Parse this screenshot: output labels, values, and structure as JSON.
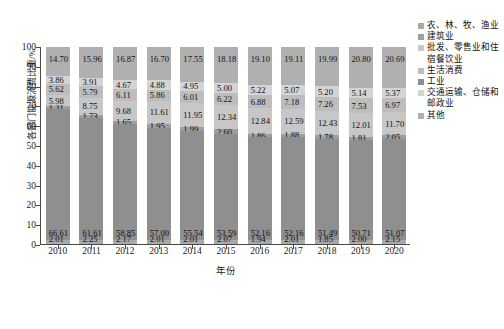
{
  "chart_data": {
    "type": "bar",
    "subtype": "stacked-percentage",
    "title": "",
    "xlabel": "年份",
    "ylabel": "各部门能源消费比重/%",
    "ylim": [
      0,
      100
    ],
    "yticks": [
      0,
      10,
      20,
      30,
      40,
      50,
      60,
      70,
      80,
      90,
      100
    ],
    "grid": false,
    "legend_position": "right",
    "categories": [
      "2010",
      "2011",
      "2012",
      "2013",
      "2014",
      "2015",
      "2016",
      "2017",
      "2018",
      "2019",
      "2020"
    ],
    "series": [
      {
        "name": "农、林、牧、渔业",
        "color": "#a9a9a9",
        "values": [
          2.01,
          2.25,
          2.17,
          2.01,
          2.01,
          2.07,
          1.94,
          2.01,
          1.85,
          2.0,
          2.15
        ]
      },
      {
        "name": "建筑业",
        "color": "#9e9e9e",
        "values": [
          1.21,
          1.73,
          1.65,
          1.95,
          1.99,
          2.6,
          1.86,
          1.88,
          1.78,
          1.81,
          2.05
        ]
      },
      {
        "name": "批发、零售业和住宿餐饮业",
        "color": "#c7c7c7",
        "values": [
          5.98,
          8.75,
          9.68,
          11.61,
          11.95,
          12.34,
          12.84,
          12.59,
          12.43,
          12.01,
          11.7
        ]
      },
      {
        "name": "生活消费",
        "color": "#bdbdbd",
        "values": [
          5.62,
          5.79,
          6.11,
          5.86,
          6.01,
          6.22,
          6.88,
          7.18,
          7.26,
          7.53,
          6.97
        ]
      },
      {
        "name": "工业",
        "color": "#8f8f8f",
        "values": [
          66.61,
          61.61,
          58.85,
          57.0,
          55.54,
          53.59,
          52.16,
          52.16,
          51.49,
          50.71,
          51.07
        ]
      },
      {
        "name": "交通运输、仓储和邮政业",
        "color": "#d4d4d4",
        "values": [
          3.86,
          3.91,
          4.67,
          4.88,
          4.95,
          5.0,
          5.22,
          5.07,
          5.2,
          5.14,
          5.37
        ]
      },
      {
        "name": "其他",
        "color": "#b0b0b0",
        "values": [
          14.7,
          15.96,
          16.87,
          16.7,
          17.55,
          18.18,
          19.1,
          19.11,
          19.99,
          20.8,
          20.69
        ]
      }
    ],
    "stack_order_bottom_to_top": [
      "农、林、牧、渔业",
      "工业",
      "建筑业",
      "批发、零售业和住宿餐饮业",
      "生活消费",
      "交通运输、仓储和邮政业",
      "其他"
    ],
    "stacks": [
      {
        "category": "2010",
        "segments": [
          {
            "name": "农、林、牧、渔业",
            "value": 2.01,
            "color": "#a9a9a9",
            "label": "2.01"
          },
          {
            "name": "工业",
            "value": 66.61,
            "color": "#8f8f8f",
            "label": "66.61"
          },
          {
            "name": "建筑业",
            "value": 1.21,
            "color": "#9e9e9e",
            "label": "1.21"
          },
          {
            "name": "批发、零售业和住宿餐饮业",
            "value": 5.98,
            "color": "#c7c7c7",
            "label": "5.98"
          },
          {
            "name": "生活消费",
            "value": 5.62,
            "color": "#bdbdbd",
            "label": "5.62"
          },
          {
            "name": "交通运输、仓储和邮政业",
            "value": 3.86,
            "color": "#d4d4d4",
            "label": "3.86"
          },
          {
            "name": "其他",
            "value": 14.7,
            "color": "#b0b0b0",
            "label": "14.70"
          }
        ]
      },
      {
        "category": "2011",
        "segments": [
          {
            "name": "农、林、牧、渔业",
            "value": 2.25,
            "color": "#a9a9a9",
            "label": "2.25"
          },
          {
            "name": "工业",
            "value": 61.61,
            "color": "#8f8f8f",
            "label": "61.61"
          },
          {
            "name": "建筑业",
            "value": 1.73,
            "color": "#9e9e9e",
            "label": "1.73"
          },
          {
            "name": "批发、零售业和住宿餐饮业",
            "value": 8.75,
            "color": "#c7c7c7",
            "label": "8.75"
          },
          {
            "name": "生活消费",
            "value": 5.79,
            "color": "#bdbdbd",
            "label": "5.79"
          },
          {
            "name": "交通运输、仓储和邮政业",
            "value": 3.91,
            "color": "#d4d4d4",
            "label": "3.91"
          },
          {
            "name": "其他",
            "value": 15.96,
            "color": "#b0b0b0",
            "label": "15.96"
          }
        ]
      },
      {
        "category": "2012",
        "segments": [
          {
            "name": "农、林、牧、渔业",
            "value": 2.17,
            "color": "#a9a9a9",
            "label": "2.17"
          },
          {
            "name": "工业",
            "value": 58.85,
            "color": "#8f8f8f",
            "label": "58.85"
          },
          {
            "name": "建筑业",
            "value": 1.65,
            "color": "#9e9e9e",
            "label": "1.65"
          },
          {
            "name": "批发、零售业和住宿餐饮业",
            "value": 9.68,
            "color": "#c7c7c7",
            "label": "9.68"
          },
          {
            "name": "生活消费",
            "value": 6.11,
            "color": "#bdbdbd",
            "label": "6.11"
          },
          {
            "name": "交通运输、仓储和邮政业",
            "value": 4.67,
            "color": "#d4d4d4",
            "label": "4.67"
          },
          {
            "name": "其他",
            "value": 16.87,
            "color": "#b0b0b0",
            "label": "16.87"
          }
        ]
      },
      {
        "category": "2013",
        "segments": [
          {
            "name": "农、林、牧、渔业",
            "value": 2.01,
            "color": "#a9a9a9",
            "label": "2.01"
          },
          {
            "name": "工业",
            "value": 57.0,
            "color": "#8f8f8f",
            "label": "57.00"
          },
          {
            "name": "建筑业",
            "value": 1.95,
            "color": "#9e9e9e",
            "label": "1.95"
          },
          {
            "name": "批发、零售业和住宿餐饮业",
            "value": 11.61,
            "color": "#c7c7c7",
            "label": "11.61"
          },
          {
            "name": "生活消费",
            "value": 5.86,
            "color": "#bdbdbd",
            "label": "5.86"
          },
          {
            "name": "交通运输、仓储和邮政业",
            "value": 4.88,
            "color": "#d4d4d4",
            "label": "4.88"
          },
          {
            "name": "其他",
            "value": 16.7,
            "color": "#b0b0b0",
            "label": "16.70"
          }
        ]
      },
      {
        "category": "2014",
        "segments": [
          {
            "name": "农、林、牧、渔业",
            "value": 2.01,
            "color": "#a9a9a9",
            "label": "2.01"
          },
          {
            "name": "工业",
            "value": 55.54,
            "color": "#8f8f8f",
            "label": "55.54"
          },
          {
            "name": "建筑业",
            "value": 1.99,
            "color": "#9e9e9e",
            "label": "1.99"
          },
          {
            "name": "批发、零售业和住宿餐饮业",
            "value": 11.95,
            "color": "#c7c7c7",
            "label": "11.95"
          },
          {
            "name": "生活消费",
            "value": 6.01,
            "color": "#bdbdbd",
            "label": "6.01"
          },
          {
            "name": "交通运输、仓储和邮政业",
            "value": 4.95,
            "color": "#d4d4d4",
            "label": "4.95"
          },
          {
            "name": "其他",
            "value": 17.55,
            "color": "#b0b0b0",
            "label": "17.55"
          }
        ]
      },
      {
        "category": "2015",
        "segments": [
          {
            "name": "农、林、牧、渔业",
            "value": 2.07,
            "color": "#a9a9a9",
            "label": "2.07"
          },
          {
            "name": "工业",
            "value": 53.59,
            "color": "#8f8f8f",
            "label": "53.59"
          },
          {
            "name": "建筑业",
            "value": 2.6,
            "color": "#9e9e9e",
            "label": "2.60"
          },
          {
            "name": "批发、零售业和住宿餐饮业",
            "value": 12.34,
            "color": "#c7c7c7",
            "label": "12.34"
          },
          {
            "name": "生活消费",
            "value": 6.22,
            "color": "#bdbdbd",
            "label": "6.22"
          },
          {
            "name": "交通运输、仓储和邮政业",
            "value": 5.0,
            "color": "#d4d4d4",
            "label": "5.00"
          },
          {
            "name": "其他",
            "value": 18.18,
            "color": "#b0b0b0",
            "label": "18.18"
          }
        ]
      },
      {
        "category": "2016",
        "segments": [
          {
            "name": "农、林、牧、渔业",
            "value": 1.94,
            "color": "#a9a9a9",
            "label": "1.94"
          },
          {
            "name": "工业",
            "value": 52.16,
            "color": "#8f8f8f",
            "label": "52.16"
          },
          {
            "name": "建筑业",
            "value": 1.86,
            "color": "#9e9e9e",
            "label": "1.86"
          },
          {
            "name": "批发、零售业和住宿餐饮业",
            "value": 12.84,
            "color": "#c7c7c7",
            "label": "12.84"
          },
          {
            "name": "生活消费",
            "value": 6.88,
            "color": "#bdbdbd",
            "label": "6.88"
          },
          {
            "name": "交通运输、仓储和邮政业",
            "value": 5.22,
            "color": "#d4d4d4",
            "label": "5.22"
          },
          {
            "name": "其他",
            "value": 19.1,
            "color": "#b0b0b0",
            "label": "19.10"
          }
        ]
      },
      {
        "category": "2017",
        "segments": [
          {
            "name": "农、林、牧、渔业",
            "value": 2.01,
            "color": "#a9a9a9",
            "label": "2.01"
          },
          {
            "name": "工业",
            "value": 52.16,
            "color": "#8f8f8f",
            "label": "52.16"
          },
          {
            "name": "建筑业",
            "value": 1.88,
            "color": "#9e9e9e",
            "label": "1.88"
          },
          {
            "name": "批发、零售业和住宿餐饮业",
            "value": 12.59,
            "color": "#c7c7c7",
            "label": "12.59"
          },
          {
            "name": "生活消费",
            "value": 7.18,
            "color": "#bdbdbd",
            "label": "7.18"
          },
          {
            "name": "交通运输、仓储和邮政业",
            "value": 5.07,
            "color": "#d4d4d4",
            "label": "5.07"
          },
          {
            "name": "其他",
            "value": 19.11,
            "color": "#b0b0b0",
            "label": "19.11"
          }
        ]
      },
      {
        "category": "2018",
        "segments": [
          {
            "name": "农、林、牧、渔业",
            "value": 1.85,
            "color": "#a9a9a9",
            "label": "1.85"
          },
          {
            "name": "工业",
            "value": 51.49,
            "color": "#8f8f8f",
            "label": "51.49"
          },
          {
            "name": "建筑业",
            "value": 1.78,
            "color": "#9e9e9e",
            "label": "1.78"
          },
          {
            "name": "批发、零售业和住宿餐饮业",
            "value": 12.43,
            "color": "#c7c7c7",
            "label": "12.43"
          },
          {
            "name": "生活消费",
            "value": 7.26,
            "color": "#bdbdbd",
            "label": "7.26"
          },
          {
            "name": "交通运输、仓储和邮政业",
            "value": 5.2,
            "color": "#d4d4d4",
            "label": "5.20"
          },
          {
            "name": "其他",
            "value": 19.99,
            "color": "#b0b0b0",
            "label": "19.99"
          }
        ]
      },
      {
        "category": "2019",
        "segments": [
          {
            "name": "农、林、牧、渔业",
            "value": 2.0,
            "color": "#a9a9a9",
            "label": "2.00"
          },
          {
            "name": "工业",
            "value": 50.71,
            "color": "#8f8f8f",
            "label": "50.71"
          },
          {
            "name": "建筑业",
            "value": 1.81,
            "color": "#9e9e9e",
            "label": "1.81"
          },
          {
            "name": "批发、零售业和住宿餐饮业",
            "value": 12.01,
            "color": "#c7c7c7",
            "label": "12.01"
          },
          {
            "name": "生活消费",
            "value": 7.53,
            "color": "#bdbdbd",
            "label": "7.53"
          },
          {
            "name": "交通运输、仓储和邮政业",
            "value": 5.14,
            "color": "#d4d4d4",
            "label": "5.14"
          },
          {
            "name": "其他",
            "value": 20.8,
            "color": "#b0b0b0",
            "label": "20.80"
          }
        ]
      },
      {
        "category": "2020",
        "segments": [
          {
            "name": "农、林、牧、渔业",
            "value": 2.15,
            "color": "#a9a9a9",
            "label": "2.15"
          },
          {
            "name": "工业",
            "value": 51.07,
            "color": "#8f8f8f",
            "label": "51.07"
          },
          {
            "name": "建筑业",
            "value": 2.05,
            "color": "#9e9e9e",
            "label": "2.05"
          },
          {
            "name": "批发、零售业和住宿餐饮业",
            "value": 11.7,
            "color": "#c7c7c7",
            "label": "11.70"
          },
          {
            "name": "生活消费",
            "value": 6.97,
            "color": "#bdbdbd",
            "label": "6.97"
          },
          {
            "name": "交通运输、仓储和邮政业",
            "value": 5.37,
            "color": "#d4d4d4",
            "label": "5.37"
          },
          {
            "name": "其他",
            "value": 20.69,
            "color": "#b0b0b0",
            "label": "20.69"
          }
        ]
      }
    ],
    "legend": [
      {
        "label": "农、林、牧、渔业",
        "color": "#a9a9a9"
      },
      {
        "label": "建筑业",
        "color": "#9e9e9e"
      },
      {
        "label": "批发、零售业和住宿餐饮业",
        "color": "#c7c7c7"
      },
      {
        "label": "生活消费",
        "color": "#bdbdbd"
      },
      {
        "label": "工业",
        "color": "#8f8f8f"
      },
      {
        "label": "交通运输、仓储和邮政业",
        "color": "#d4d4d4"
      },
      {
        "label": "其他",
        "color": "#b0b0b0"
      }
    ]
  }
}
